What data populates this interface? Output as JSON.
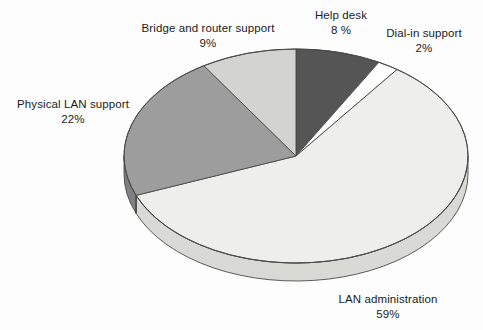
{
  "chart_data": {
    "type": "pie",
    "title": "",
    "subtitle": "",
    "xlabel": "",
    "ylabel": "",
    "three_d": true,
    "legend_position": "callout-labels",
    "grid": false,
    "start_angle_deg": 0,
    "direction": "clockwise",
    "categories": [
      "Help desk",
      "Dial-in support",
      "LAN administration",
      "Physical LAN support",
      "Bridge and router support"
    ],
    "values": [
      8,
      2,
      59,
      22,
      9
    ],
    "units": "percent",
    "total": 100,
    "slices": [
      {
        "label": "Help desk",
        "percent_text": "8 %",
        "value": 8,
        "color": "#555555",
        "side_color": "#3e3e3e",
        "start_deg": 0,
        "end_deg": 28.8
      },
      {
        "label": "Dial-in support",
        "percent_text": "2%",
        "value": 2,
        "color": "#ffffff",
        "side_color": "#e6e6e6",
        "start_deg": 28.8,
        "end_deg": 36.0
      },
      {
        "label": "LAN administration",
        "percent_text": "59%",
        "value": 59,
        "color": "#eeeeec",
        "side_color": "#d9d9d6",
        "start_deg": 36.0,
        "end_deg": 248.4
      },
      {
        "label": "Physical LAN support",
        "percent_text": "22%",
        "value": 22,
        "color": "#9d9d9d",
        "side_color": "#7f7f7f",
        "start_deg": 248.4,
        "end_deg": 327.6
      },
      {
        "label": "Bridge and router support",
        "percent_text": "9%",
        "value": 9,
        "color": "#d3d3d1",
        "side_color": "#b5b5b3",
        "start_deg": 327.6,
        "end_deg": 360.0
      }
    ]
  },
  "labels": {
    "bridge": {
      "name": "Bridge and router support",
      "percent": "9%"
    },
    "helpdesk": {
      "name": "Help desk",
      "percent": "8 %"
    },
    "dialin": {
      "name": "Dial-in support",
      "percent": "2%"
    },
    "physical": {
      "name": "Physical LAN support",
      "percent": "22%"
    },
    "lanadmin": {
      "name": "LAN administration",
      "percent": "59%"
    }
  },
  "geometry": {
    "cx": 296,
    "cy": 156,
    "rx": 172,
    "ry": 107,
    "depth": 18
  },
  "colors": {
    "background": "#fdfdfd",
    "outline": "#4a4a4a",
    "text": "#1b1b1b"
  }
}
